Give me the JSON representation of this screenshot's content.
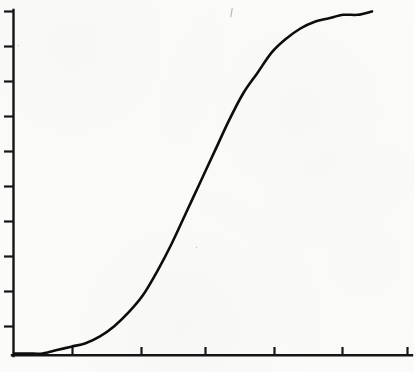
{
  "chart_data": {
    "type": "line",
    "title": "",
    "subtitle": "",
    "xlabel": "",
    "ylabel": "",
    "grid": false,
    "legend": false,
    "legend_position": "none",
    "xlim": [
      0,
      100
    ],
    "ylim": [
      0,
      100
    ],
    "x_tick_labels": [
      "",
      "",
      "",
      "",
      "",
      ""
    ],
    "y_tick_labels": [
      "",
      "",
      "",
      "",
      "",
      "",
      "",
      "",
      "",
      ""
    ],
    "x_tick_count": 6,
    "y_tick_count": 10,
    "series": [
      {
        "name": "sigmoid",
        "color": "#0d0d0d",
        "x": [
          0,
          4,
          8,
          12,
          16,
          20,
          24,
          28,
          32,
          36,
          40,
          44,
          48,
          52,
          56,
          60,
          64,
          68,
          72,
          76,
          80,
          84,
          88,
          92,
          96,
          100
        ],
        "values": [
          0,
          0,
          0,
          1,
          2,
          3,
          5,
          8,
          12,
          17,
          24,
          32,
          41,
          50,
          59,
          68,
          76,
          82,
          88,
          92,
          95,
          97,
          98,
          99,
          99,
          100
        ]
      }
    ],
    "annotations": []
  },
  "figure": {
    "background_color": "#fbfbfa",
    "ink_color": "#0d0d0d",
    "axis_color": "#141414"
  },
  "axes": {
    "y_axis_name": "y-axis",
    "x_axis_name": "x-axis"
  },
  "artifacts": {
    "speck_label": "scan-speck"
  }
}
